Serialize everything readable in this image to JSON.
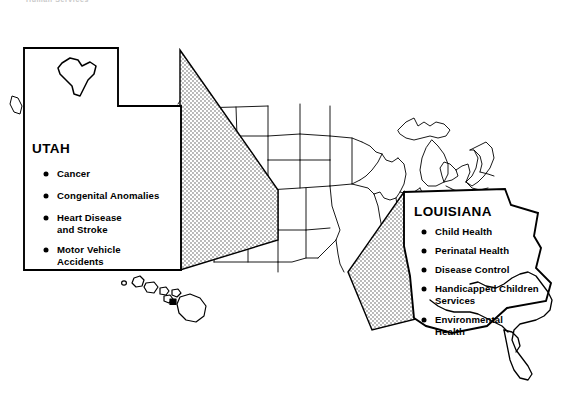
{
  "page": {
    "header_caption": "Human Services"
  },
  "figure": {
    "type": "map-with-callouts",
    "map_name": "united-states-map",
    "background_color": "#ffffff",
    "line_color": "#000000",
    "fill_color": "#ffffff",
    "wedge_fill": "stippled-dot-pattern"
  },
  "callouts": [
    {
      "id": "utah",
      "title": "UTAH",
      "shape": "utah-state-outline",
      "inset_icon": "alaska-outline",
      "items": [
        "Cancer",
        "Congenital Anomalies",
        "Heart Disease\nand Stroke",
        "Motor Vehicle\nAccidents"
      ],
      "items_flat": [
        {
          "line1": "Cancer",
          "line2": ""
        },
        {
          "line1": "Congenital Anomalies",
          "line2": ""
        },
        {
          "line1": "Heart Disease",
          "line2": "and Stroke"
        },
        {
          "line1": "Motor Vehicle",
          "line2": "Accidents"
        }
      ]
    },
    {
      "id": "louisiana",
      "title": "LOUISIANA",
      "shape": "louisiana-state-outline",
      "items": [
        "Child Health",
        "Perinatal Health",
        "Disease Control",
        "Handicapped Children\nServices",
        "Environmental\nHealth"
      ],
      "items_flat": [
        {
          "line1": "Child Health",
          "line2": ""
        },
        {
          "line1": "Perinatal Health",
          "line2": ""
        },
        {
          "line1": "Disease Control",
          "line2": ""
        },
        {
          "line1": "Handicapped Children",
          "line2": "Services"
        },
        {
          "line1": "Environmental",
          "line2": "Health"
        }
      ]
    }
  ],
  "map_extras": {
    "hawaii_label": "hawaii-islands",
    "alaska_label": "alaska-outline"
  }
}
